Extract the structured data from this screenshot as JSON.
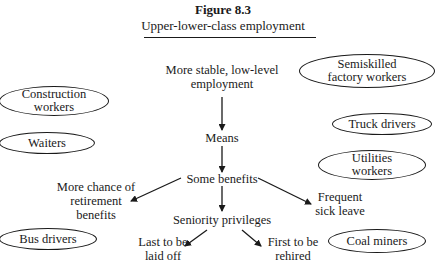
{
  "figure": {
    "number": "Figure 8.3",
    "title": "Upper-lower-class employment"
  },
  "flow": {
    "root": {
      "line1": "More stable, low-level",
      "line2": "employment"
    },
    "means": "Means",
    "benefits": "Some benefits",
    "retirement": {
      "line1": "More chance of",
      "line2": "retirement",
      "line3": "benefits"
    },
    "sick_leave": {
      "line1": "Frequent",
      "line2": "sick leave"
    },
    "seniority": "Seniority privileges",
    "laid_off": {
      "line1": "Last to be",
      "line2": "laid off"
    },
    "rehired": {
      "line1": "First to be",
      "line2": "rehired"
    }
  },
  "occupations": {
    "construction": {
      "line1": "Construction",
      "line2": "workers"
    },
    "waiters": "Waiters",
    "bus_drivers": "Bus drivers",
    "semiskilled": {
      "line1": "Semiskilled",
      "line2": "factory workers"
    },
    "truck_drivers": "Truck drivers",
    "utilities": {
      "line1": "Utilities",
      "line2": "workers"
    },
    "coal_miners": "Coal miners"
  },
  "colors": {
    "ink": "#1a1a1a",
    "background": "#ffffff"
  }
}
